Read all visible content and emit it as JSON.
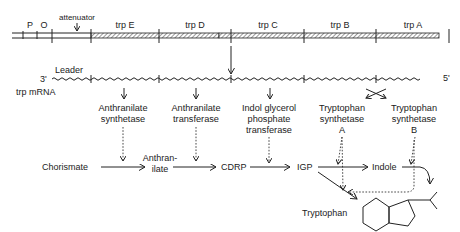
{
  "operon": {
    "elements": [
      {
        "id": "P",
        "label": "P"
      },
      {
        "id": "O",
        "label": "O"
      },
      {
        "id": "attenuator",
        "label": "attenuator"
      },
      {
        "id": "trpE",
        "label": "trp E"
      },
      {
        "id": "trpD",
        "label": "trp D"
      },
      {
        "id": "trpC",
        "label": "trp C"
      },
      {
        "id": "trpB",
        "label": "trp B"
      },
      {
        "id": "trpA",
        "label": "trp A"
      }
    ]
  },
  "mrna": {
    "leader_label": "Leader",
    "three_prime": "3'",
    "five_prime": "5'",
    "name": "trp mRNA"
  },
  "enzymes": [
    {
      "lines": [
        "Anthranilate",
        "synthetase"
      ]
    },
    {
      "lines": [
        "Anthranilate",
        "transferase"
      ]
    },
    {
      "lines": [
        "Indol glycerol",
        "phosphate",
        "transferase"
      ]
    },
    {
      "lines": [
        "Tryptophan",
        "synthetase",
        "A"
      ]
    },
    {
      "lines": [
        "Tryptophan",
        "synthetase",
        "B"
      ]
    }
  ],
  "pathway": {
    "chorismate": "Chorismate",
    "anthranilate_1": "Anthran-",
    "anthranilate_2": "ilate",
    "cdrp": "CDRP",
    "igp": "IGP",
    "indole": "Indole",
    "tryptophan": "Tryptophan"
  }
}
